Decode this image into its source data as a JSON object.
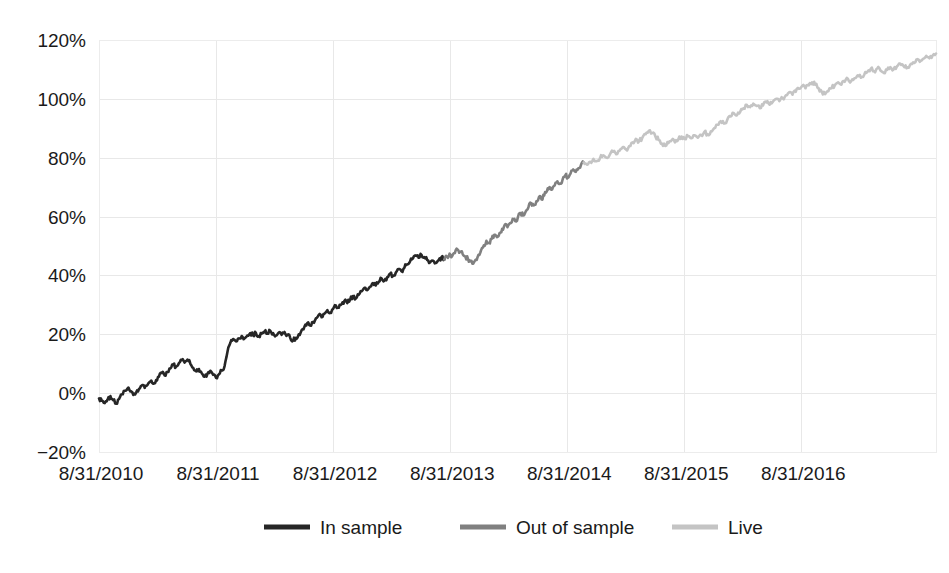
{
  "chart_data": {
    "type": "line",
    "title": "",
    "subtitle": "",
    "xlabel": "",
    "ylabel": "",
    "grid": true,
    "legend_position": "bottom",
    "ylim": [
      -20,
      120
    ],
    "ytick_labels": [
      "120%",
      "100%",
      "80%",
      "60%",
      "40%",
      "20%",
      "0%",
      "-20%"
    ],
    "ytick_values": [
      120,
      100,
      80,
      60,
      40,
      20,
      0,
      -20
    ],
    "xtick_labels": [
      "8/31/2010",
      "8/31/2011",
      "8/31/2012",
      "8/31/2013",
      "8/31/2014",
      "8/31/2015",
      "8/31/2016"
    ],
    "xtick_values": [
      0,
      1,
      2,
      3,
      4,
      5,
      6
    ],
    "xlim": [
      0,
      7.15
    ],
    "x_unit": "years since 8/31/2010",
    "y_unit": "cumulative return (%)",
    "segment_breaks": {
      "in_sample_end_x": 2.95,
      "out_of_sample_end_x": 4.14
    },
    "series": [
      {
        "name": "In sample",
        "color": "#262626",
        "x_start": 0,
        "x_end": 2.95,
        "values": [
          -1.8,
          -2.6,
          -3.4,
          -2.2,
          -1.0,
          -2.4,
          -3.6,
          -2.0,
          -0.4,
          0.8,
          1.6,
          0.6,
          -0.6,
          0.2,
          1.4,
          2.6,
          1.8,
          2.8,
          4.0,
          3.2,
          4.4,
          5.6,
          6.8,
          6.0,
          7.2,
          8.4,
          9.6,
          9.0,
          10.2,
          11.2,
          10.4,
          11.4,
          10.0,
          8.6,
          7.4,
          8.2,
          6.8,
          5.6,
          6.6,
          7.6,
          6.2,
          5.2,
          6.4,
          7.8,
          9.2,
          14.0,
          17.0,
          18.4,
          17.6,
          18.6,
          19.4,
          18.6,
          19.6,
          20.4,
          19.6,
          20.4,
          19.4,
          20.2,
          21.0,
          20.2,
          21.2,
          20.4,
          19.6,
          20.6,
          19.8,
          20.8,
          19.8,
          18.8,
          17.8,
          18.8,
          20.0,
          21.4,
          22.6,
          23.8,
          23.0,
          24.2,
          25.4,
          26.6,
          25.8,
          27.0,
          28.2,
          27.4,
          28.6,
          29.8,
          29.0,
          30.2,
          31.4,
          30.6,
          31.8,
          33.0,
          32.2,
          33.4,
          34.6,
          35.8,
          35.0,
          36.2,
          37.4,
          36.6,
          37.8,
          39.0,
          38.2,
          39.4,
          40.6,
          39.8,
          41.0,
          42.2,
          41.4,
          42.6,
          43.8,
          44.8,
          45.8,
          46.8,
          46.0,
          47.0,
          46.2,
          45.2,
          44.4,
          45.0,
          44.2,
          45.2,
          46.2,
          45.4
        ]
      },
      {
        "name": "Out of sample",
        "color": "#808080",
        "x_start": 2.95,
        "x_end": 4.14,
        "values": [
          45.4,
          46.4,
          47.4,
          46.6,
          47.6,
          48.8,
          48.0,
          47.2,
          46.4,
          45.6,
          44.8,
          44.0,
          45.4,
          47.0,
          48.6,
          50.2,
          51.8,
          51.0,
          52.4,
          53.8,
          53.0,
          54.4,
          55.8,
          57.2,
          56.4,
          57.8,
          59.2,
          58.4,
          59.8,
          61.2,
          60.4,
          61.8,
          63.2,
          64.6,
          63.8,
          65.2,
          66.6,
          65.8,
          67.2,
          68.6,
          70.0,
          69.2,
          70.6,
          72.0,
          71.2,
          72.6,
          74.0,
          73.2,
          74.6,
          76.0,
          75.2,
          76.4,
          77.6,
          78.4
        ]
      },
      {
        "name": "Live",
        "color": "#c4c4c4",
        "x_start": 4.14,
        "x_end": 7.15,
        "values": [
          78.4,
          77.6,
          78.6,
          79.6,
          78.8,
          79.8,
          80.8,
          80.0,
          81.0,
          82.0,
          81.2,
          82.4,
          83.6,
          82.8,
          84.0,
          85.2,
          86.4,
          85.6,
          86.8,
          88.0,
          89.2,
          88.4,
          87.2,
          86.0,
          84.8,
          84.0,
          85.0,
          86.0,
          85.2,
          86.2,
          87.2,
          86.4,
          87.4,
          86.6,
          87.6,
          86.8,
          87.8,
          88.8,
          88.0,
          89.0,
          90.0,
          91.2,
          92.4,
          91.6,
          92.8,
          94.0,
          95.2,
          94.4,
          95.6,
          96.8,
          98.0,
          97.2,
          98.4,
          97.6,
          96.8,
          97.8,
          98.8,
          98.0,
          99.0,
          100.0,
          99.2,
          100.2,
          101.2,
          102.2,
          101.4,
          102.4,
          103.4,
          104.4,
          103.6,
          104.6,
          105.6,
          104.8,
          103.6,
          102.4,
          101.6,
          102.6,
          103.6,
          104.6,
          105.6,
          104.8,
          105.8,
          106.8,
          106.0,
          107.0,
          108.0,
          107.2,
          108.2,
          109.2,
          110.2,
          109.4,
          110.4,
          109.6,
          108.8,
          109.8,
          110.8,
          110.0,
          111.0,
          112.0,
          111.2,
          110.4,
          111.4,
          112.4,
          113.4,
          112.6,
          113.6,
          114.6,
          113.8,
          114.8,
          115.4
        ]
      }
    ]
  },
  "legend": {
    "items": [
      {
        "label": "In sample",
        "color": "#262626"
      },
      {
        "label": "Out of sample",
        "color": "#808080"
      },
      {
        "label": "Live",
        "color": "#c4c4c4"
      }
    ]
  }
}
